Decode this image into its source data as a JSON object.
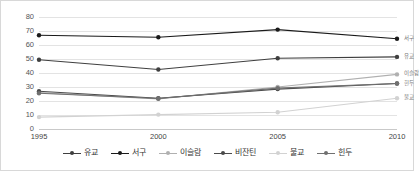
{
  "chart_data": {
    "type": "line",
    "title": "",
    "xlabel": "",
    "ylabel": "",
    "categories": [
      "1995",
      "2000",
      "2005",
      "2010"
    ],
    "x_tick_labels": [
      "1995",
      "2000",
      "2005",
      "2010"
    ],
    "y_tick_labels": [
      "0",
      "10",
      "20",
      "30",
      "40",
      "50",
      "60",
      "70",
      "80"
    ],
    "y_ticks": [
      0,
      10,
      20,
      30,
      40,
      50,
      60,
      70,
      80
    ],
    "ylim": [
      0,
      80
    ],
    "grid": "horizontal",
    "legend_position": "bottom",
    "series": [
      {
        "name": "유교",
        "values": [
          49.5,
          42.5,
          50.5,
          51.5
        ],
        "color": "#3f3f3f",
        "marker": "circle",
        "end_label": "유교"
      },
      {
        "name": "서구",
        "values": [
          67,
          65.5,
          71,
          64.5
        ],
        "color": "#1a1a1a",
        "marker": "circle",
        "end_label": "서구"
      },
      {
        "name": "이슬람",
        "values": [
          26,
          21.5,
          30,
          39
        ],
        "color": "#b0b0b0",
        "marker": "circle",
        "end_label": "이슬람"
      },
      {
        "name": "비잔틴",
        "values": [
          27,
          22,
          28.5,
          32.5
        ],
        "color": "#4a4a4a",
        "marker": "circle",
        "end_label": "힌두"
      },
      {
        "name": "불교",
        "values": [
          8.5,
          10.3,
          12,
          22
        ],
        "color": "#d2d2d2",
        "marker": "circle",
        "end_label": "불교"
      },
      {
        "name": "힌두",
        "values": [
          25.5,
          21.8,
          29.2,
          32.5
        ],
        "color": "#707070",
        "marker": "circle",
        "end_label": ""
      }
    ],
    "end_labels": [
      {
        "text": "서구",
        "value": 64.5
      },
      {
        "text": "유교",
        "value": 51.5
      },
      {
        "text": "이슬람",
        "value": 39
      },
      {
        "text": "힌두",
        "value": 32.5
      },
      {
        "text": "불교",
        "value": 22
      }
    ],
    "legend": [
      {
        "label": "유교",
        "color": "#3f3f3f"
      },
      {
        "label": "서구",
        "color": "#1a1a1a"
      },
      {
        "label": "이슬람",
        "color": "#b0b0b0"
      },
      {
        "label": "비잔틴",
        "color": "#4a4a4a"
      },
      {
        "label": "불교",
        "color": "#d2d2d2"
      },
      {
        "label": "힌두",
        "color": "#707070"
      }
    ],
    "colors": {
      "grid": "#e3e3e3",
      "border": "#d8d8d8",
      "background": "#ffffff",
      "tick_text": "#555555"
    }
  }
}
